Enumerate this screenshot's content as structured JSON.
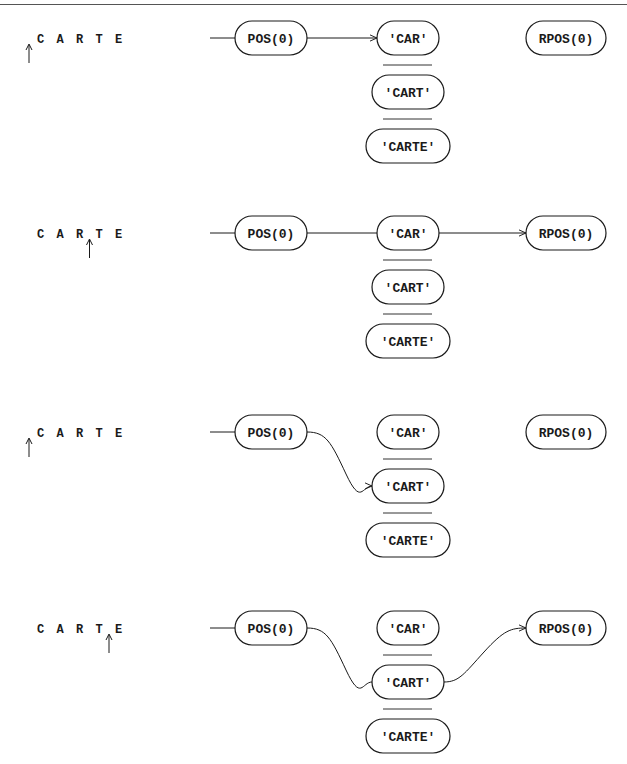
{
  "panels": [
    {
      "subject": "CARTE",
      "cursor_position": 0,
      "nodes": {
        "start": "POS(0)",
        "alternatives": [
          "'CAR'",
          "'CART'",
          "'CARTE'"
        ],
        "end": "RPOS(0)"
      },
      "path": {
        "from": "POS(0)",
        "to_alternative": "'CAR'",
        "continues_to_end": false
      }
    },
    {
      "subject": "CARTE",
      "cursor_position": 3,
      "nodes": {
        "start": "POS(0)",
        "alternatives": [
          "'CAR'",
          "'CART'",
          "'CARTE'"
        ],
        "end": "RPOS(0)"
      },
      "path": {
        "from": "POS(0)",
        "to_alternative": "'CAR'",
        "continues_to_end": true
      }
    },
    {
      "subject": "CARTE",
      "cursor_position": 0,
      "nodes": {
        "start": "POS(0)",
        "alternatives": [
          "'CAR'",
          "'CART'",
          "'CARTE'"
        ],
        "end": "RPOS(0)"
      },
      "path": {
        "from": "POS(0)",
        "to_alternative": "'CART'",
        "continues_to_end": false
      }
    },
    {
      "subject": "CARTE",
      "cursor_position": 4,
      "nodes": {
        "start": "POS(0)",
        "alternatives": [
          "'CAR'",
          "'CART'",
          "'CARTE'"
        ],
        "end": "RPOS(0)"
      },
      "path": {
        "from": "POS(0)",
        "to_alternative": "'CART'",
        "continues_to_end": true
      }
    }
  ],
  "colors": {
    "ink": "#1a1a1a",
    "background": "#ffffff"
  }
}
